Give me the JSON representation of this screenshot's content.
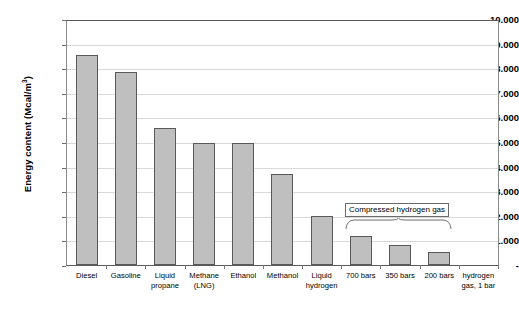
{
  "chart_data": {
    "type": "bar",
    "title": "",
    "xlabel": "",
    "ylabel": "Energy content (Mcal/m3)",
    "ylabel_main": "Energy content (Mcal/m",
    "ylabel_sup": "3",
    "ylabel_tail": ")",
    "ylim": [
      0,
      10000
    ],
    "grid": true,
    "legend": "none",
    "categories": [
      "Diesel",
      "Gasoline",
      "Liquid propane",
      "Methane (LNG)",
      "Ethanol",
      "Methanol",
      "Liquid hydrogen",
      "700 bars",
      "350 bars",
      "200 bars",
      "hydrogen gas, 1 bar"
    ],
    "category_lines": [
      [
        "Diesel"
      ],
      [
        "Gasoline"
      ],
      [
        "Liquid",
        "propane"
      ],
      [
        "Methane",
        "(LNG)"
      ],
      [
        "Ethanol"
      ],
      [
        "Methanol"
      ],
      [
        "Liquid",
        "hydrogen"
      ],
      [
        "700 bars"
      ],
      [
        "350 bars"
      ],
      [
        "200 bars"
      ],
      [
        "hydrogen",
        "gas, 1 bar"
      ]
    ],
    "values": [
      8600,
      7900,
      5600,
      5000,
      5000,
      3750,
      2000,
      1200,
      800,
      550,
      0
    ],
    "ytick_values": [
      10000,
      9000,
      8000,
      7000,
      6000,
      5000,
      4000,
      3000,
      2000,
      1000,
      0
    ],
    "ytick_labels": [
      "10.000",
      "9.000",
      "8.000",
      "7.000",
      "6.000",
      "5.000",
      "4.000",
      "3.000",
      "2.000",
      "1.000",
      "-"
    ],
    "annotations": [
      {
        "text": "Compressed hydrogen gas",
        "spans_categories": [
          "700 bars",
          "350 bars",
          "200 bars"
        ]
      }
    ],
    "colors": {
      "bar_fill": "#bfbfbf",
      "bar_border": "#595959",
      "gridline": "#d9d9d9",
      "frame": "#808080",
      "background": "#ffffff",
      "text": "#000000"
    }
  }
}
